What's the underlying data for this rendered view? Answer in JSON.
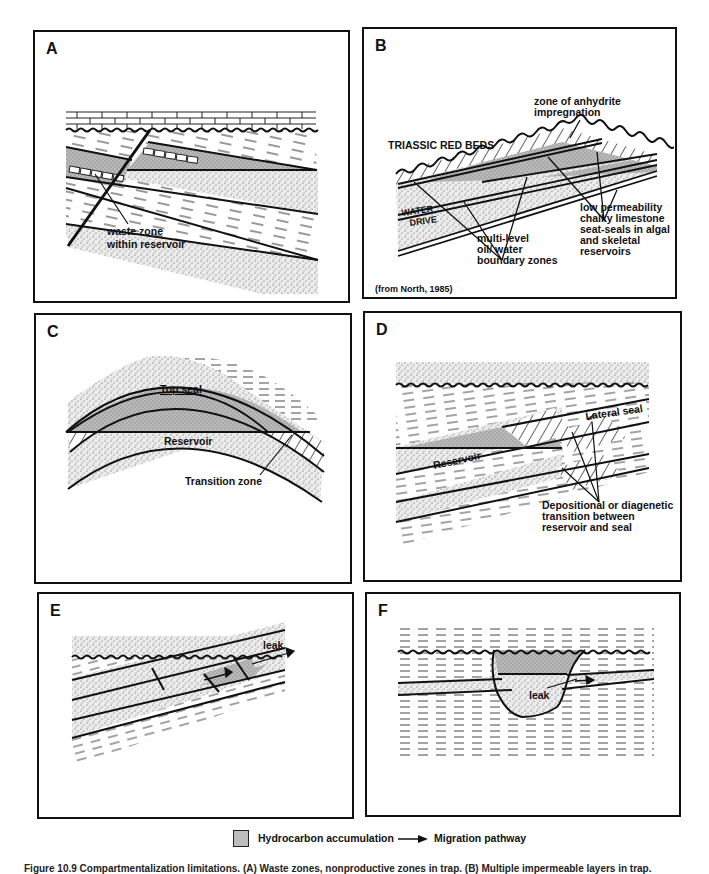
{
  "figure": {
    "panels": [
      {
        "id": "A",
        "letter": "A",
        "labels": {
          "waste_zone_1": "waste zone",
          "waste_zone_2": "within reservoir"
        }
      },
      {
        "id": "B",
        "letter": "B",
        "labels": {
          "anhydrite_1": "zone of anhydrite",
          "anhydrite_2": "impregnation",
          "red_beds": "TRIASSIC RED BEDS",
          "water": "WATER",
          "drive": "DRIVE",
          "oilwater_1": "multi-level",
          "oilwater_2": "oil/ water",
          "oilwater_3": "boundary zones",
          "chalky_1": "low permeability",
          "chalky_2": "chalky limestone",
          "chalky_3": "seat-seals in algal",
          "chalky_4": "and skeletal",
          "chalky_5": "reservoirs",
          "source": "(from North, 1985)"
        }
      },
      {
        "id": "C",
        "letter": "C",
        "labels": {
          "top_seal": "Top seal",
          "reservoir": "Reservoir",
          "transition": "Transition zone"
        }
      },
      {
        "id": "D",
        "letter": "D",
        "labels": {
          "lateral_seal": "Lateral seal",
          "reservoir": "Reservoir",
          "transition_1": "Depositional or diagenetic",
          "transition_2": "transition between",
          "transition_3": "reservoir and seal"
        }
      },
      {
        "id": "E",
        "letter": "E",
        "labels": {
          "leak": "leak"
        }
      },
      {
        "id": "F",
        "letter": "F",
        "labels": {
          "leak": "leak"
        }
      }
    ],
    "legend": {
      "hydrocarbon": "Hydrocarbon accumulation",
      "migration": "Migration pathway",
      "colors": {
        "hydrocarbon_fill": "#bdbdbd",
        "stipple_bg": "#e6e6e6",
        "line": "#111111"
      }
    },
    "caption": "Figure 10.9  Compartmentalization limitations. (A) Waste zones, nonproductive zones in trap. (B) Multiple impermeable layers in trap."
  }
}
